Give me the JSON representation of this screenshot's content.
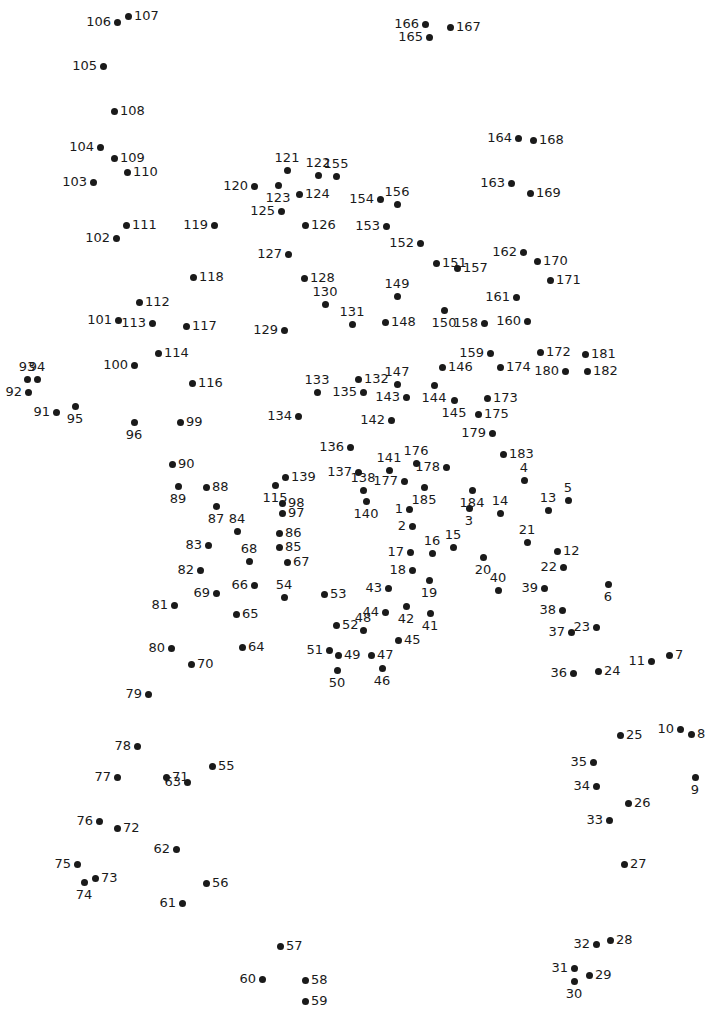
{
  "page": {
    "width": 715,
    "height": 1013,
    "background_color": "#ffffff",
    "dot_color": "#1a1a1a",
    "label_color": "#1a1a1a",
    "dot_count": 185
  },
  "dots": [
    {
      "n": "1",
      "x": 409,
      "y": 509,
      "pos": "l"
    },
    {
      "n": "2",
      "x": 412,
      "y": 526,
      "pos": "l"
    },
    {
      "n": "3",
      "x": 469,
      "y": 508,
      "pos": "b"
    },
    {
      "n": "4",
      "x": 524,
      "y": 480,
      "pos": "t"
    },
    {
      "n": "5",
      "x": 568,
      "y": 500,
      "pos": "t"
    },
    {
      "n": "6",
      "x": 608,
      "y": 584,
      "pos": "b"
    },
    {
      "n": "7",
      "x": 669,
      "y": 655,
      "pos": "r"
    },
    {
      "n": "8",
      "x": 691,
      "y": 734,
      "pos": "r"
    },
    {
      "n": "9",
      "x": 695,
      "y": 777,
      "pos": "b"
    },
    {
      "n": "10",
      "x": 680,
      "y": 729,
      "pos": "l"
    },
    {
      "n": "11",
      "x": 651,
      "y": 661,
      "pos": "l"
    },
    {
      "n": "12",
      "x": 557,
      "y": 551,
      "pos": "r"
    },
    {
      "n": "13",
      "x": 548,
      "y": 510,
      "pos": "t"
    },
    {
      "n": "14",
      "x": 500,
      "y": 513,
      "pos": "t"
    },
    {
      "n": "15",
      "x": 453,
      "y": 547,
      "pos": "t"
    },
    {
      "n": "16",
      "x": 432,
      "y": 553,
      "pos": "t"
    },
    {
      "n": "17",
      "x": 410,
      "y": 552,
      "pos": "l"
    },
    {
      "n": "18",
      "x": 412,
      "y": 570,
      "pos": "l"
    },
    {
      "n": "19",
      "x": 429,
      "y": 580,
      "pos": "b"
    },
    {
      "n": "20",
      "x": 483,
      "y": 557,
      "pos": "b"
    },
    {
      "n": "21",
      "x": 527,
      "y": 542,
      "pos": "t"
    },
    {
      "n": "22",
      "x": 563,
      "y": 567,
      "pos": "l"
    },
    {
      "n": "23",
      "x": 596,
      "y": 627,
      "pos": "l"
    },
    {
      "n": "24",
      "x": 598,
      "y": 671,
      "pos": "r"
    },
    {
      "n": "25",
      "x": 620,
      "y": 735,
      "pos": "r"
    },
    {
      "n": "26",
      "x": 628,
      "y": 803,
      "pos": "r"
    },
    {
      "n": "27",
      "x": 624,
      "y": 864,
      "pos": "r"
    },
    {
      "n": "28",
      "x": 610,
      "y": 940,
      "pos": "r"
    },
    {
      "n": "29",
      "x": 589,
      "y": 975,
      "pos": "r"
    },
    {
      "n": "30",
      "x": 574,
      "y": 981,
      "pos": "b"
    },
    {
      "n": "31",
      "x": 574,
      "y": 968,
      "pos": "l"
    },
    {
      "n": "32",
      "x": 596,
      "y": 944,
      "pos": "l"
    },
    {
      "n": "33",
      "x": 609,
      "y": 820,
      "pos": "l"
    },
    {
      "n": "34",
      "x": 596,
      "y": 786,
      "pos": "l"
    },
    {
      "n": "35",
      "x": 593,
      "y": 762,
      "pos": "l"
    },
    {
      "n": "36",
      "x": 573,
      "y": 673,
      "pos": "l"
    },
    {
      "n": "37",
      "x": 571,
      "y": 632,
      "pos": "l"
    },
    {
      "n": "38",
      "x": 562,
      "y": 610,
      "pos": "l"
    },
    {
      "n": "39",
      "x": 544,
      "y": 588,
      "pos": "l"
    },
    {
      "n": "40",
      "x": 498,
      "y": 590,
      "pos": "t"
    },
    {
      "n": "41",
      "x": 430,
      "y": 613,
      "pos": "b"
    },
    {
      "n": "42",
      "x": 406,
      "y": 606,
      "pos": "b"
    },
    {
      "n": "43",
      "x": 388,
      "y": 588,
      "pos": "l"
    },
    {
      "n": "44",
      "x": 385,
      "y": 612,
      "pos": "l"
    },
    {
      "n": "45",
      "x": 398,
      "y": 640,
      "pos": "r"
    },
    {
      "n": "46",
      "x": 382,
      "y": 668,
      "pos": "b"
    },
    {
      "n": "47",
      "x": 371,
      "y": 655,
      "pos": "r"
    },
    {
      "n": "48",
      "x": 363,
      "y": 630,
      "pos": "t"
    },
    {
      "n": "49",
      "x": 338,
      "y": 655,
      "pos": "r"
    },
    {
      "n": "50",
      "x": 337,
      "y": 670,
      "pos": "b"
    },
    {
      "n": "51",
      "x": 329,
      "y": 650,
      "pos": "l"
    },
    {
      "n": "52",
      "x": 336,
      "y": 625,
      "pos": "r"
    },
    {
      "n": "53",
      "x": 324,
      "y": 594,
      "pos": "r"
    },
    {
      "n": "54",
      "x": 284,
      "y": 597,
      "pos": "t"
    },
    {
      "n": "55",
      "x": 212,
      "y": 766,
      "pos": "r"
    },
    {
      "n": "56",
      "x": 206,
      "y": 883,
      "pos": "r"
    },
    {
      "n": "57",
      "x": 280,
      "y": 946,
      "pos": "r"
    },
    {
      "n": "58",
      "x": 305,
      "y": 980,
      "pos": "r"
    },
    {
      "n": "59",
      "x": 305,
      "y": 1001,
      "pos": "r"
    },
    {
      "n": "60",
      "x": 262,
      "y": 979,
      "pos": "l"
    },
    {
      "n": "61",
      "x": 182,
      "y": 903,
      "pos": "l"
    },
    {
      "n": "62",
      "x": 176,
      "y": 849,
      "pos": "l"
    },
    {
      "n": "63",
      "x": 187,
      "y": 782,
      "pos": "l"
    },
    {
      "n": "64",
      "x": 242,
      "y": 647,
      "pos": "r"
    },
    {
      "n": "65",
      "x": 236,
      "y": 614,
      "pos": "r"
    },
    {
      "n": "66",
      "x": 254,
      "y": 585,
      "pos": "l"
    },
    {
      "n": "67",
      "x": 287,
      "y": 562,
      "pos": "r"
    },
    {
      "n": "68",
      "x": 249,
      "y": 561,
      "pos": "t"
    },
    {
      "n": "69",
      "x": 216,
      "y": 593,
      "pos": "l"
    },
    {
      "n": "70",
      "x": 191,
      "y": 664,
      "pos": "r"
    },
    {
      "n": "71",
      "x": 166,
      "y": 777,
      "pos": "r"
    },
    {
      "n": "72",
      "x": 117,
      "y": 828,
      "pos": "r"
    },
    {
      "n": "73",
      "x": 95,
      "y": 878,
      "pos": "r"
    },
    {
      "n": "74",
      "x": 84,
      "y": 882,
      "pos": "b"
    },
    {
      "n": "75",
      "x": 77,
      "y": 864,
      "pos": "l"
    },
    {
      "n": "76",
      "x": 99,
      "y": 821,
      "pos": "l"
    },
    {
      "n": "77",
      "x": 117,
      "y": 777,
      "pos": "l"
    },
    {
      "n": "78",
      "x": 137,
      "y": 746,
      "pos": "l"
    },
    {
      "n": "79",
      "x": 148,
      "y": 694,
      "pos": "l"
    },
    {
      "n": "80",
      "x": 171,
      "y": 648,
      "pos": "l"
    },
    {
      "n": "81",
      "x": 174,
      "y": 605,
      "pos": "l"
    },
    {
      "n": "82",
      "x": 200,
      "y": 570,
      "pos": "l"
    },
    {
      "n": "83",
      "x": 208,
      "y": 545,
      "pos": "l"
    },
    {
      "n": "84",
      "x": 237,
      "y": 531,
      "pos": "t"
    },
    {
      "n": "85",
      "x": 279,
      "y": 547,
      "pos": "r"
    },
    {
      "n": "86",
      "x": 279,
      "y": 533,
      "pos": "r"
    },
    {
      "n": "87",
      "x": 216,
      "y": 506,
      "pos": "b"
    },
    {
      "n": "88",
      "x": 206,
      "y": 487,
      "pos": "r"
    },
    {
      "n": "89",
      "x": 178,
      "y": 486,
      "pos": "b"
    },
    {
      "n": "90",
      "x": 172,
      "y": 464,
      "pos": "r"
    },
    {
      "n": "91",
      "x": 56,
      "y": 412,
      "pos": "l"
    },
    {
      "n": "92",
      "x": 28,
      "y": 392,
      "pos": "l"
    },
    {
      "n": "93",
      "x": 27,
      "y": 379,
      "pos": "t"
    },
    {
      "n": "94",
      "x": 37,
      "y": 379,
      "pos": "t"
    },
    {
      "n": "95",
      "x": 75,
      "y": 406,
      "pos": "b"
    },
    {
      "n": "96",
      "x": 134,
      "y": 422,
      "pos": "b"
    },
    {
      "n": "97",
      "x": 282,
      "y": 513,
      "pos": "r"
    },
    {
      "n": "98",
      "x": 282,
      "y": 503,
      "pos": "r"
    },
    {
      "n": "99",
      "x": 180,
      "y": 422,
      "pos": "r"
    },
    {
      "n": "100",
      "x": 134,
      "y": 365,
      "pos": "l"
    },
    {
      "n": "101",
      "x": 118,
      "y": 320,
      "pos": "l"
    },
    {
      "n": "102",
      "x": 116,
      "y": 238,
      "pos": "l"
    },
    {
      "n": "103",
      "x": 93,
      "y": 182,
      "pos": "l"
    },
    {
      "n": "104",
      "x": 100,
      "y": 147,
      "pos": "l"
    },
    {
      "n": "105",
      "x": 103,
      "y": 66,
      "pos": "l"
    },
    {
      "n": "106",
      "x": 117,
      "y": 22,
      "pos": "l"
    },
    {
      "n": "107",
      "x": 128,
      "y": 16,
      "pos": "r"
    },
    {
      "n": "108",
      "x": 114,
      "y": 111,
      "pos": "r"
    },
    {
      "n": "109",
      "x": 114,
      "y": 158,
      "pos": "r"
    },
    {
      "n": "110",
      "x": 127,
      "y": 172,
      "pos": "r"
    },
    {
      "n": "111",
      "x": 126,
      "y": 225,
      "pos": "r"
    },
    {
      "n": "112",
      "x": 139,
      "y": 302,
      "pos": "r"
    },
    {
      "n": "113",
      "x": 152,
      "y": 323,
      "pos": "l"
    },
    {
      "n": "114",
      "x": 158,
      "y": 353,
      "pos": "r"
    },
    {
      "n": "115",
      "x": 275,
      "y": 485,
      "pos": "b"
    },
    {
      "n": "116",
      "x": 192,
      "y": 383,
      "pos": "r"
    },
    {
      "n": "117",
      "x": 186,
      "y": 326,
      "pos": "r"
    },
    {
      "n": "118",
      "x": 193,
      "y": 277,
      "pos": "r"
    },
    {
      "n": "119",
      "x": 214,
      "y": 225,
      "pos": "l"
    },
    {
      "n": "120",
      "x": 254,
      "y": 186,
      "pos": "l"
    },
    {
      "n": "121",
      "x": 287,
      "y": 170,
      "pos": "t"
    },
    {
      "n": "122",
      "x": 318,
      "y": 175,
      "pos": "t"
    },
    {
      "n": "123",
      "x": 278,
      "y": 185,
      "pos": "b"
    },
    {
      "n": "124",
      "x": 299,
      "y": 194,
      "pos": "r"
    },
    {
      "n": "125",
      "x": 281,
      "y": 211,
      "pos": "l"
    },
    {
      "n": "126",
      "x": 305,
      "y": 225,
      "pos": "r"
    },
    {
      "n": "127",
      "x": 288,
      "y": 254,
      "pos": "l"
    },
    {
      "n": "128",
      "x": 304,
      "y": 278,
      "pos": "r"
    },
    {
      "n": "129",
      "x": 284,
      "y": 330,
      "pos": "l"
    },
    {
      "n": "130",
      "x": 325,
      "y": 304,
      "pos": "t"
    },
    {
      "n": "131",
      "x": 352,
      "y": 324,
      "pos": "t"
    },
    {
      "n": "132",
      "x": 358,
      "y": 379,
      "pos": "r"
    },
    {
      "n": "133",
      "x": 317,
      "y": 392,
      "pos": "t"
    },
    {
      "n": "134",
      "x": 298,
      "y": 416,
      "pos": "l"
    },
    {
      "n": "135",
      "x": 363,
      "y": 392,
      "pos": "l"
    },
    {
      "n": "136",
      "x": 350,
      "y": 447,
      "pos": "l"
    },
    {
      "n": "137",
      "x": 358,
      "y": 472,
      "pos": "l"
    },
    {
      "n": "138",
      "x": 363,
      "y": 490,
      "pos": "t"
    },
    {
      "n": "139",
      "x": 285,
      "y": 477,
      "pos": "r"
    },
    {
      "n": "140",
      "x": 366,
      "y": 501,
      "pos": "b"
    },
    {
      "n": "141",
      "x": 389,
      "y": 470,
      "pos": "t"
    },
    {
      "n": "142",
      "x": 391,
      "y": 420,
      "pos": "l"
    },
    {
      "n": "143",
      "x": 406,
      "y": 397,
      "pos": "l"
    },
    {
      "n": "144",
      "x": 434,
      "y": 385,
      "pos": "b"
    },
    {
      "n": "145",
      "x": 454,
      "y": 400,
      "pos": "b"
    },
    {
      "n": "146",
      "x": 442,
      "y": 367,
      "pos": "r"
    },
    {
      "n": "147",
      "x": 397,
      "y": 384,
      "pos": "t"
    },
    {
      "n": "148",
      "x": 385,
      "y": 322,
      "pos": "r"
    },
    {
      "n": "149",
      "x": 397,
      "y": 296,
      "pos": "t"
    },
    {
      "n": "150",
      "x": 444,
      "y": 310,
      "pos": "b"
    },
    {
      "n": "151",
      "x": 436,
      "y": 263,
      "pos": "r"
    },
    {
      "n": "152",
      "x": 420,
      "y": 243,
      "pos": "l"
    },
    {
      "n": "153",
      "x": 386,
      "y": 226,
      "pos": "l"
    },
    {
      "n": "154",
      "x": 380,
      "y": 199,
      "pos": "l"
    },
    {
      "n": "155",
      "x": 336,
      "y": 176,
      "pos": "t"
    },
    {
      "n": "156",
      "x": 397,
      "y": 204,
      "pos": "t"
    },
    {
      "n": "157",
      "x": 457,
      "y": 268,
      "pos": "r"
    },
    {
      "n": "158",
      "x": 484,
      "y": 323,
      "pos": "l"
    },
    {
      "n": "159",
      "x": 490,
      "y": 353,
      "pos": "l"
    },
    {
      "n": "160",
      "x": 527,
      "y": 321,
      "pos": "l"
    },
    {
      "n": "161",
      "x": 516,
      "y": 297,
      "pos": "l"
    },
    {
      "n": "162",
      "x": 523,
      "y": 252,
      "pos": "l"
    },
    {
      "n": "163",
      "x": 511,
      "y": 183,
      "pos": "l"
    },
    {
      "n": "164",
      "x": 518,
      "y": 138,
      "pos": "l"
    },
    {
      "n": "165",
      "x": 429,
      "y": 37,
      "pos": "l"
    },
    {
      "n": "166",
      "x": 425,
      "y": 24,
      "pos": "l"
    },
    {
      "n": "167",
      "x": 450,
      "y": 27,
      "pos": "r"
    },
    {
      "n": "168",
      "x": 533,
      "y": 140,
      "pos": "r"
    },
    {
      "n": "169",
      "x": 530,
      "y": 193,
      "pos": "r"
    },
    {
      "n": "170",
      "x": 537,
      "y": 261,
      "pos": "r"
    },
    {
      "n": "171",
      "x": 550,
      "y": 280,
      "pos": "r"
    },
    {
      "n": "172",
      "x": 540,
      "y": 352,
      "pos": "r"
    },
    {
      "n": "173",
      "x": 487,
      "y": 398,
      "pos": "r"
    },
    {
      "n": "174",
      "x": 500,
      "y": 367,
      "pos": "r"
    },
    {
      "n": "175",
      "x": 478,
      "y": 414,
      "pos": "r"
    },
    {
      "n": "176",
      "x": 416,
      "y": 463,
      "pos": "t"
    },
    {
      "n": "177",
      "x": 404,
      "y": 481,
      "pos": "l"
    },
    {
      "n": "178",
      "x": 446,
      "y": 467,
      "pos": "l"
    },
    {
      "n": "179",
      "x": 492,
      "y": 433,
      "pos": "l"
    },
    {
      "n": "180",
      "x": 565,
      "y": 371,
      "pos": "l"
    },
    {
      "n": "181",
      "x": 585,
      "y": 354,
      "pos": "r"
    },
    {
      "n": "182",
      "x": 587,
      "y": 371,
      "pos": "r"
    },
    {
      "n": "183",
      "x": 503,
      "y": 454,
      "pos": "r"
    },
    {
      "n": "184",
      "x": 472,
      "y": 490,
      "pos": "b"
    },
    {
      "n": "185",
      "x": 424,
      "y": 487,
      "pos": "b"
    }
  ]
}
